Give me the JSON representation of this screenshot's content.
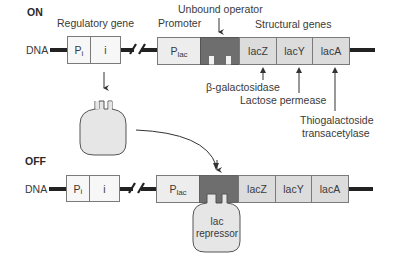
{
  "on": {
    "state_label": "ON",
    "regulatory_gene_label": "Regulatory gene",
    "promoter_label": "Promoter",
    "operator_label": "Unbound operator",
    "structural_genes_label": "Structural genes",
    "dna_label": "DNA",
    "pi_box": {
      "main": "P",
      "sub": "i"
    },
    "i_box": "i",
    "plac_box": {
      "main": "P",
      "sub": "lac"
    },
    "genes": [
      "lacZ",
      "lacY",
      "lacA"
    ],
    "products": [
      "β-galactosidase",
      "Lactose permease",
      "Thiogalactoside",
      "transacetylase"
    ],
    "repressor": [
      "lac",
      "repressor"
    ]
  },
  "off": {
    "state_label": "OFF",
    "dna_label": "DNA",
    "pi_box": {
      "main": "P",
      "sub": "i"
    },
    "i_box": "i",
    "plac_box": {
      "main": "P",
      "sub": "lac"
    },
    "genes": [
      "lacZ",
      "lacY",
      "lacA"
    ],
    "repressor": [
      "lac",
      "repressor"
    ]
  },
  "colors": {
    "operator": "#6e6e6e",
    "gene_box": "#dcdcdc",
    "promoter_box": "#ededed",
    "dna": "#222222",
    "repressor": "#e6e6e6"
  }
}
